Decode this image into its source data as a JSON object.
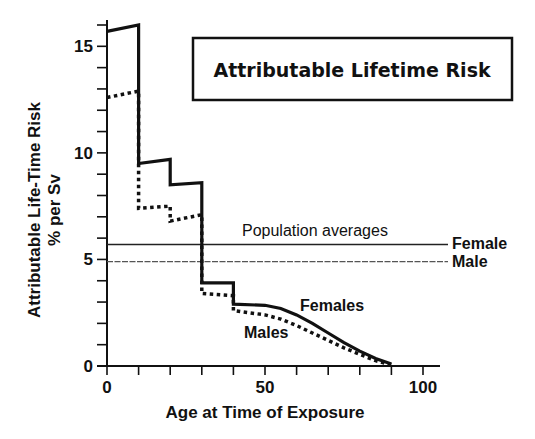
{
  "chart_data": {
    "type": "line",
    "title": "Attributable Lifetime Risk",
    "xlabel": "Age at Time of Exposure",
    "ylabel_line1": "Attributable Life-Time Risk",
    "ylabel_line2": "% per Sv",
    "xlim": [
      0,
      100
    ],
    "ylim": [
      0,
      16
    ],
    "x_ticks": [
      0,
      50,
      100
    ],
    "x_minor_step": 10,
    "y_ticks": [
      0,
      5,
      10,
      15
    ],
    "y_minor_step": 1,
    "grid": false,
    "series": [
      {
        "name": "Females",
        "style": "solid",
        "points": [
          [
            0,
            15.7
          ],
          [
            10,
            16.0
          ],
          [
            10,
            9.5
          ],
          [
            20,
            9.7
          ],
          [
            20,
            8.5
          ],
          [
            30,
            8.6
          ],
          [
            30,
            3.9
          ],
          [
            40,
            3.9
          ],
          [
            40,
            2.9
          ],
          [
            50,
            2.85
          ],
          [
            55,
            2.7
          ],
          [
            60,
            2.4
          ],
          [
            65,
            2.0
          ],
          [
            70,
            1.55
          ],
          [
            75,
            1.1
          ],
          [
            80,
            0.7
          ],
          [
            85,
            0.35
          ],
          [
            90,
            0.1
          ]
        ]
      },
      {
        "name": "Males",
        "style": "dotted",
        "points": [
          [
            0,
            12.6
          ],
          [
            10,
            12.9
          ],
          [
            10,
            7.4
          ],
          [
            20,
            7.5
          ],
          [
            20,
            6.8
          ],
          [
            30,
            7.1
          ],
          [
            30,
            3.4
          ],
          [
            40,
            3.3
          ],
          [
            40,
            2.6
          ],
          [
            50,
            2.4
          ],
          [
            55,
            2.2
          ],
          [
            60,
            1.9
          ],
          [
            65,
            1.55
          ],
          [
            70,
            1.2
          ],
          [
            75,
            0.85
          ],
          [
            80,
            0.55
          ],
          [
            85,
            0.25
          ],
          [
            90,
            0.05
          ]
        ]
      }
    ],
    "reference_lines": [
      {
        "name": "Female",
        "value": 5.7,
        "style": "solid"
      },
      {
        "name": "Male",
        "value": 4.9,
        "style": "dashed"
      }
    ],
    "annotations": {
      "population_averages": "Population averages",
      "females_label": "Females",
      "males_label": "Males"
    }
  }
}
